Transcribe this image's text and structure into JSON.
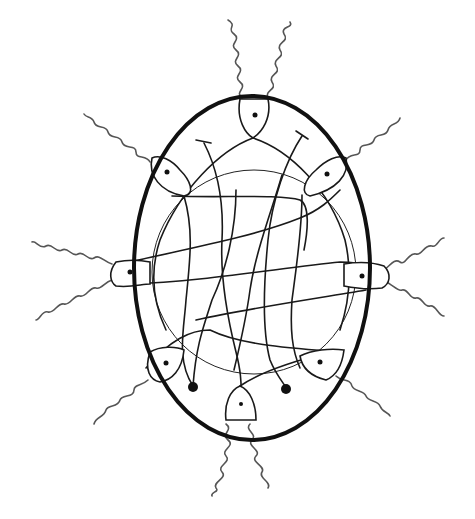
{
  "figure": {
    "colors": {
      "line": "#111111",
      "braid": "#555555",
      "background": "#ffffff"
    },
    "outline": {
      "cx": 252,
      "cy": 268,
      "rx": 118,
      "ry": 172
    },
    "inner_circle": {
      "cx": 254,
      "cy": 272,
      "r": 102
    },
    "lobes": [
      {
        "name": "top",
        "x": 253,
        "y": 117
      },
      {
        "name": "upper-left",
        "x": 165,
        "y": 172
      },
      {
        "name": "upper-right",
        "x": 328,
        "y": 172
      },
      {
        "name": "left",
        "x": 130,
        "y": 272
      },
      {
        "name": "right",
        "x": 362,
        "y": 276
      },
      {
        "name": "lower-left",
        "x": 166,
        "y": 363
      },
      {
        "name": "lower-right",
        "x": 320,
        "y": 362
      },
      {
        "name": "bottom",
        "x": 241,
        "y": 404
      }
    ],
    "knobs": [
      {
        "x": 193,
        "y": 386
      },
      {
        "x": 287,
        "y": 389
      }
    ],
    "t_ends": [
      {
        "x": 204,
        "y": 143
      },
      {
        "x": 302,
        "y": 136
      }
    ]
  }
}
